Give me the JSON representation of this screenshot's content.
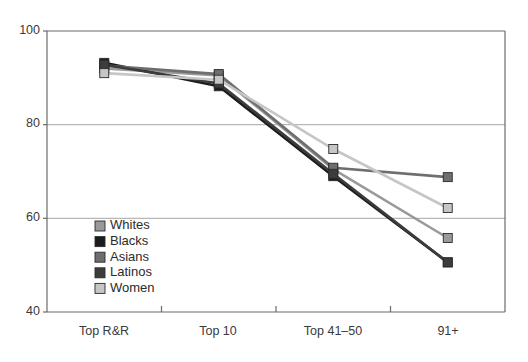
{
  "chart_data": {
    "type": "line",
    "title": "",
    "subtitle": "",
    "xlabel": "",
    "ylabel": "",
    "categories": [
      "Top R&R",
      "Top 10",
      "Top 41–50",
      "91+"
    ],
    "ylim": [
      40,
      100
    ],
    "yticks": [
      40,
      60,
      80,
      100
    ],
    "ytick_labels": [
      "40",
      "60",
      "80",
      "100"
    ],
    "grid": "horizontal",
    "legend_position": "inside-lower-left",
    "series": [
      {
        "name": "Whites",
        "color": "#9a9a9a",
        "marker": "square",
        "values": [
          92.0,
          90.5,
          70.5,
          55.8
        ]
      },
      {
        "name": "Blacks",
        "color": "#1c1c1c",
        "marker": "square",
        "values": [
          93.2,
          88.2,
          69.0,
          50.6
        ]
      },
      {
        "name": "Asians",
        "color": "#6e6e6e",
        "marker": "square",
        "values": [
          92.6,
          90.8,
          70.8,
          68.8
        ]
      },
      {
        "name": "Latinos",
        "color": "#3c3c3c",
        "marker": "square",
        "values": [
          92.8,
          88.8,
          69.5,
          50.6
        ]
      },
      {
        "name": "Women",
        "color": "#c6c6c6",
        "marker": "square",
        "values": [
          91.0,
          89.6,
          74.8,
          62.2
        ]
      }
    ]
  },
  "axes": {
    "y_labels": [
      "100",
      "80",
      "60",
      "40"
    ],
    "x_labels": [
      "Top R&R",
      "Top 10",
      "Top 41–50",
      "91+"
    ]
  },
  "legend": {
    "items": [
      {
        "label": "Whites",
        "swatch": "#9a9a9a"
      },
      {
        "label": "Blacks",
        "swatch": "#1c1c1c"
      },
      {
        "label": "Asians",
        "swatch": "#6e6e6e"
      },
      {
        "label": "Latinos",
        "swatch": "#3c3c3c"
      },
      {
        "label": "Women",
        "swatch": "#c6c6c6"
      }
    ]
  },
  "colors": {
    "frame": "#6b6b6b",
    "grid": "#b7b7b7",
    "background": "#ffffff",
    "text": "#2b2b2b"
  }
}
